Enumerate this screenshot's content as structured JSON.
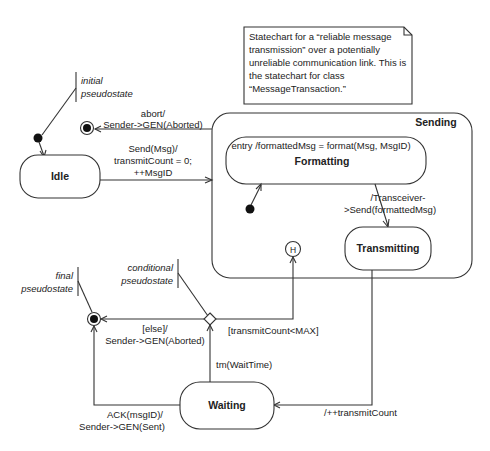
{
  "note": {
    "lines": [
      "Statechart for a “reliable message",
      "transmission” over a potentially",
      "unreliable communication link. This is",
      "the statechart for class",
      "“MessageTransaction.”"
    ]
  },
  "annotations": {
    "initial": [
      "initial",
      "pseudostate"
    ],
    "conditional": [
      "conditional",
      "pseudostate"
    ],
    "final": [
      "final",
      "pseudostate"
    ]
  },
  "states": {
    "idle": "Idle",
    "sending": "Sending",
    "formatting": "Formatting",
    "formatting_entry": "entry /formattedMsg = format(Msg, MsgID)",
    "transmitting": "Transmitting",
    "waiting": "Waiting",
    "history": "H"
  },
  "transitions": {
    "abort": [
      "abort/",
      "Sender->GEN(Aborted)"
    ],
    "send": [
      "Send(Msg)/",
      "transmitCount = 0;",
      "++MsgID"
    ],
    "transceiver": [
      "/Transceiver-",
      ">Send(formattedMsg)"
    ],
    "increment": "/++transmitCount",
    "timeout": "tm(WaitTime)",
    "guard_retry": "[transmitCount<MAX]",
    "else": [
      "[else]/",
      "Sender->GEN(Aborted)"
    ],
    "ack": [
      "ACK(msgID)/",
      "Sender->GEN(Sent)"
    ]
  }
}
